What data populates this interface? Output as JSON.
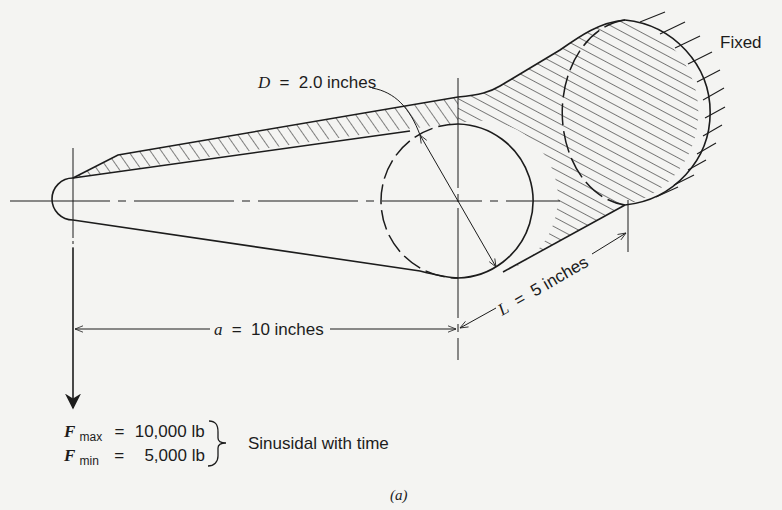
{
  "figure": {
    "caption": "(a)",
    "labels": {
      "fixed": "Fixed",
      "diameter": {
        "symbol": "D",
        "equals": "=",
        "value": "2.0 inches"
      },
      "moment_arm": {
        "symbol": "a",
        "equals": "=",
        "value": "10 inches"
      },
      "length": {
        "symbol": "L",
        "equals": "=",
        "value": "5 inches"
      }
    },
    "loads": {
      "f_max": {
        "symbol": "F",
        "subscript": "max",
        "equals": "=",
        "value": "10,000 lb"
      },
      "f_min": {
        "symbol": "F",
        "subscript": "min",
        "equals": "=",
        "value": "5,000 lb"
      },
      "note": "Sinusidal with time"
    }
  },
  "colors": {
    "ink": "#1c1c1c",
    "paper": "#f4f4f2"
  }
}
